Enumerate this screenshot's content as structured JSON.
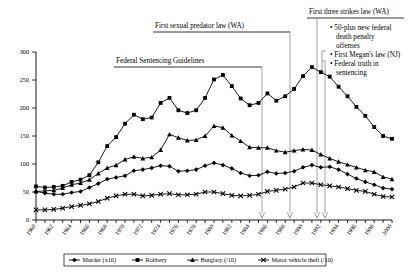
{
  "chart_data": {
    "type": "line",
    "title": "",
    "xlabel": "",
    "ylabel": "",
    "xlim": [
      1960,
      2000
    ],
    "ylim": [
      0,
      300
    ],
    "yticks": [
      0,
      50,
      100,
      150,
      200,
      250,
      300
    ],
    "grid": false,
    "legend_position": "bottom",
    "x": [
      1960,
      1961,
      1962,
      1963,
      1964,
      1965,
      1966,
      1967,
      1968,
      1969,
      1970,
      1971,
      1972,
      1973,
      1974,
      1975,
      1976,
      1977,
      1978,
      1979,
      1980,
      1981,
      1982,
      1983,
      1984,
      1985,
      1986,
      1987,
      1988,
      1989,
      1990,
      1991,
      1992,
      1993,
      1994,
      1995,
      1996,
      1997,
      1998,
      1999,
      2000
    ],
    "xticks": [
      1960,
      1962,
      1964,
      1966,
      1968,
      1970,
      1972,
      1974,
      1976,
      1978,
      1980,
      1982,
      1984,
      1986,
      1988,
      1990,
      1992,
      1994,
      1996,
      1998,
      2000
    ],
    "series": [
      {
        "name": "Murder (x10)",
        "marker": "diamond",
        "values": [
          51,
          48,
          46,
          46,
          49,
          51,
          58,
          65,
          73,
          76,
          79,
          88,
          90,
          93,
          97,
          96,
          87,
          88,
          90,
          97,
          102,
          98,
          92,
          84,
          79,
          80,
          86,
          83,
          84,
          87,
          94,
          98,
          94,
          95,
          90,
          82,
          74,
          68,
          63,
          57,
          55
        ]
      },
      {
        "name": "Robbery",
        "marker": "square",
        "values": [
          60,
          58,
          59,
          61,
          68,
          72,
          80,
          103,
          132,
          148,
          172,
          188,
          180,
          183,
          209,
          218,
          196,
          191,
          196,
          218,
          251,
          259,
          239,
          217,
          205,
          209,
          226,
          213,
          221,
          234,
          257,
          273,
          264,
          256,
          238,
          221,
          202,
          186,
          166,
          150,
          145
        ]
      },
      {
        "name": "Burglary (/10)",
        "marker": "triangle",
        "values": [
          51,
          52,
          53,
          57,
          63,
          66,
          72,
          83,
          93,
          98,
          108,
          113,
          110,
          112,
          125,
          153,
          147,
          142,
          143,
          150,
          168,
          165,
          151,
          141,
          130,
          129,
          129,
          124,
          121,
          124,
          126,
          125,
          117,
          110,
          104,
          99,
          94,
          89,
          86,
          77,
          73
        ]
      },
      {
        "name": "Motor vehicle theft (/10)",
        "marker": "x",
        "values": [
          18,
          18,
          19,
          21,
          24,
          26,
          29,
          33,
          39,
          43,
          46,
          46,
          43,
          44,
          46,
          47,
          45,
          45,
          46,
          50,
          50,
          47,
          44,
          43,
          44,
          46,
          51,
          53,
          55,
          59,
          66,
          66,
          63,
          61,
          59,
          56,
          53,
          51,
          46,
          42,
          41
        ]
      }
    ],
    "annotations": [
      {
        "label": "Federal Sentencing Guidelines",
        "target_year": 1987
      },
      {
        "label": "First sexual predator law (WA)",
        "target_year": 1990
      },
      {
        "label": "First three strikes law (WA)",
        "target_year": 1993
      },
      {
        "label": "",
        "target_year": 1994,
        "bullets": [
          "50-plus new federal death penalty offenses",
          "First Megan's law (NJ)",
          "Federal truth in sentencing"
        ]
      }
    ],
    "bullet_lines": [
      "• 50-plus new federal",
      "death penalty",
      "offenses",
      "• First Megan's law (NJ)",
      "• Federal truth in",
      "sentencing"
    ]
  }
}
